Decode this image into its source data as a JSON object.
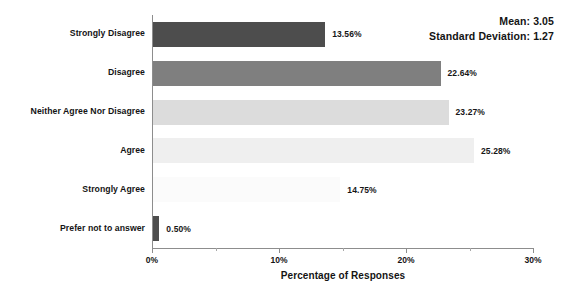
{
  "chart_data": {
    "type": "bar",
    "orientation": "horizontal",
    "title": "",
    "xlabel": "Percentage of Responses",
    "ylabel": "",
    "xlim": [
      0,
      30
    ],
    "x_tick_labels": [
      "0%",
      "10%",
      "20%",
      "30%"
    ],
    "x_tick_values": [
      0,
      10,
      20,
      30
    ],
    "x_minor_tick_values": [
      5,
      15,
      25
    ],
    "grid": false,
    "legend": "none",
    "categories": [
      "Strongly Disagree",
      "Disagree",
      "Neither Agree Nor Disagree",
      "Agree",
      "Strongly Agree",
      "Prefer not to answer"
    ],
    "values": [
      13.56,
      22.64,
      23.27,
      25.28,
      14.75,
      0.5
    ],
    "value_labels": [
      "13.56%",
      "22.64%",
      "23.27%",
      "25.28%",
      "14.75%",
      "0.50%"
    ],
    "bar_colors": [
      "#4d4d4d",
      "#7f7f7f",
      "#dcdcdc",
      "#efefef",
      "#fbfbfb",
      "#4d4d4d"
    ],
    "annotations": {
      "mean_label": "Mean: 3.05",
      "std_label": "Standard Deviation: 1.27"
    }
  },
  "axis_colors": {
    "line": "#8d8d8d",
    "text": "#141414",
    "background": "#ffffff"
  }
}
